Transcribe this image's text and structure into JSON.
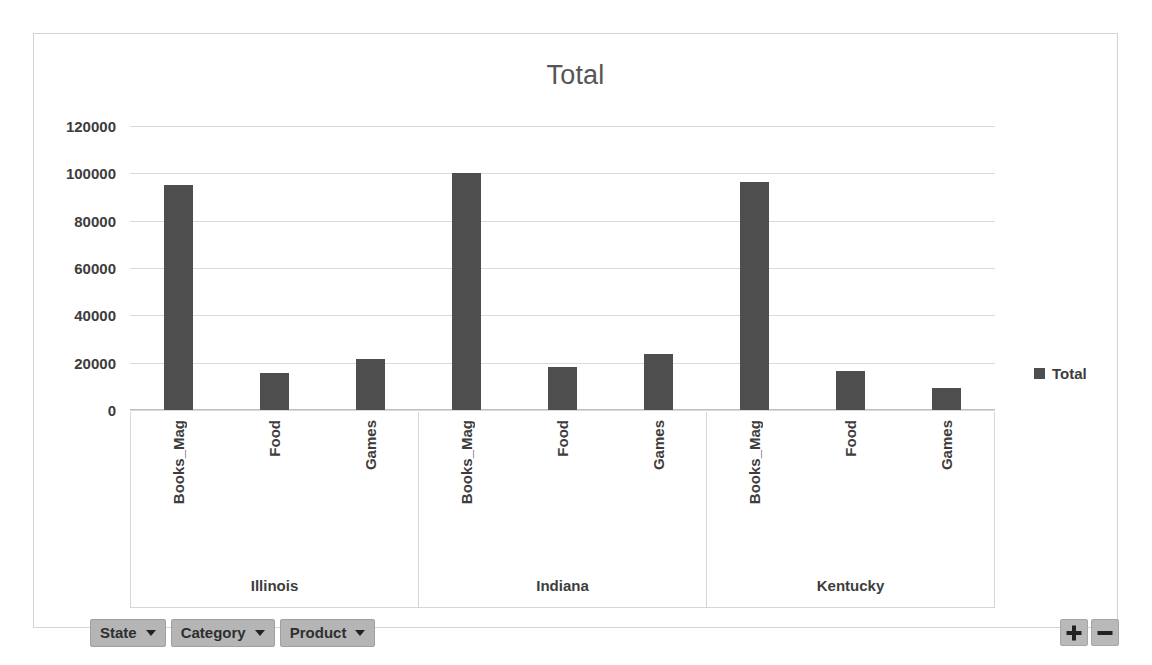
{
  "chart": {
    "title": "Total",
    "legend": {
      "label": "Total",
      "marker_color": "#4e4e4e",
      "position": "right"
    }
  },
  "field_buttons": [
    {
      "label": "State",
      "icon": "chevron-down-icon"
    },
    {
      "label": "Category",
      "icon": "chevron-down-icon"
    },
    {
      "label": "Product",
      "icon": "chevron-down-icon"
    }
  ],
  "controls": {
    "expand": "+",
    "collapse": "−"
  },
  "chart_data": {
    "type": "bar",
    "title": "Total",
    "xlabel": "",
    "ylabel": "",
    "ylim": [
      0,
      120000
    ],
    "yticks": [
      "0",
      "20000",
      "40000",
      "60000",
      "80000",
      "100000",
      "120000"
    ],
    "ytick_values": [
      0,
      20000,
      40000,
      60000,
      80000,
      100000,
      120000
    ],
    "grid": true,
    "legend": [
      "Total"
    ],
    "bar_color": "#4e4e4e",
    "groups": [
      "Illinois",
      "Indiana",
      "Kentucky"
    ],
    "categories": [
      "Books_Mag",
      "Food",
      "Games"
    ],
    "series": [
      {
        "name": "Total",
        "points": [
          {
            "group": "Illinois",
            "category": "Books_Mag",
            "value": 95000
          },
          {
            "group": "Illinois",
            "category": "Food",
            "value": 15500
          },
          {
            "group": "Illinois",
            "category": "Games",
            "value": 21500
          },
          {
            "group": "Indiana",
            "category": "Books_Mag",
            "value": 100000
          },
          {
            "group": "Indiana",
            "category": "Food",
            "value": 18000
          },
          {
            "group": "Indiana",
            "category": "Games",
            "value": 23500
          },
          {
            "group": "Kentucky",
            "category": "Books_Mag",
            "value": 96500
          },
          {
            "group": "Kentucky",
            "category": "Food",
            "value": 16500
          },
          {
            "group": "Kentucky",
            "category": "Games",
            "value": 9300
          }
        ]
      }
    ]
  }
}
